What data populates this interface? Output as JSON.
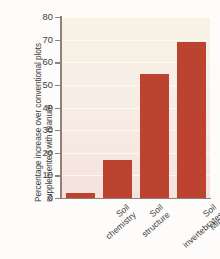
{
  "chart_data": {
    "type": "bar",
    "title": "",
    "xlabel": "",
    "ylabel": "Percentage increase over conventional plots supplemented with manure",
    "categories": [
      "Soil chemistry",
      "Soil structure",
      "Soil invertebrates",
      "Microbial activity"
    ],
    "category_lines": [
      [
        "Soil",
        "chemistry"
      ],
      [
        "Soil",
        "structure"
      ],
      [
        "Soil",
        "invertebrates"
      ],
      [
        "Microbial",
        "activity"
      ]
    ],
    "values": [
      2,
      17,
      55,
      69
    ],
    "ylim": [
      0,
      80
    ],
    "yticks": [
      0,
      10,
      20,
      30,
      40,
      50,
      60,
      70,
      80
    ],
    "ytick_labels": [
      "0",
      "10",
      "20",
      "30",
      "40",
      "50",
      "60",
      "70",
      "80"
    ],
    "grid": true,
    "legend": "none",
    "bar_color": "#bc4330",
    "plot_background_top": "#f8f2e5",
    "plot_background_bottom": "#f5e2dd",
    "axis_color": "#8c8279",
    "text_color": "#3b3b3b"
  }
}
